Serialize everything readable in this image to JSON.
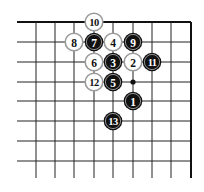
{
  "diagram": {
    "type": "go-board-corner",
    "corner": "top-right",
    "colors": {
      "background": "#ffffff",
      "grid_line": "#222222",
      "border_line": "#111111",
      "black_stone": "#111111",
      "black_stone_ring": "#e6e6e6",
      "black_stone_text": "#ffffff",
      "white_stone": "#ffffff",
      "white_stone_border": "#9a9a9a",
      "white_stone_text": "#111111",
      "star_point": "#111111"
    },
    "grid": {
      "columns_x": [
        36,
        55,
        74,
        94,
        113,
        133,
        152,
        171,
        191
      ],
      "rows_y": [
        22,
        42,
        62,
        82,
        101,
        121,
        141,
        161
      ],
      "line_start_x": 17,
      "line_end_y": 178,
      "top_edge_y": 22,
      "right_edge_x": 191
    },
    "star_points": [
      {
        "col": 5,
        "row": 3
      }
    ],
    "stones": [
      {
        "move": "1",
        "color": "black",
        "col": 5,
        "row": 4
      },
      {
        "move": "2",
        "color": "white",
        "col": 5,
        "row": 2
      },
      {
        "move": "3",
        "color": "black",
        "col": 4,
        "row": 2
      },
      {
        "move": "4",
        "color": "white",
        "col": 4,
        "row": 1
      },
      {
        "move": "5",
        "color": "black",
        "col": 4,
        "row": 3
      },
      {
        "move": "6",
        "color": "white",
        "col": 3,
        "row": 2
      },
      {
        "move": "7",
        "color": "black",
        "col": 3,
        "row": 1
      },
      {
        "move": "8",
        "color": "white",
        "col": 2,
        "row": 1
      },
      {
        "move": "9",
        "color": "black",
        "col": 5,
        "row": 1
      },
      {
        "move": "10",
        "color": "white",
        "col": 3,
        "row": 0
      },
      {
        "move": "11",
        "color": "black",
        "col": 6,
        "row": 2
      },
      {
        "move": "12",
        "color": "white",
        "col": 3,
        "row": 3
      },
      {
        "move": "13",
        "color": "black",
        "col": 4,
        "row": 5
      }
    ]
  }
}
